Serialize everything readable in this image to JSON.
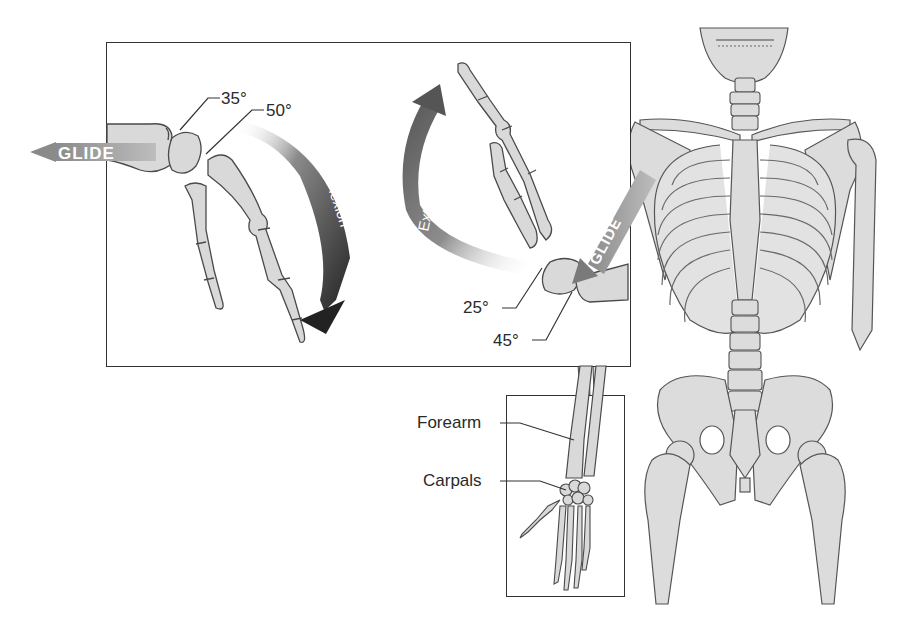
{
  "figure": {
    "main_panel": {
      "flexion_side": {
        "arrow_label": "Flexion",
        "glide_label": "GLIDE",
        "angles": [
          {
            "id": "a35",
            "label": "35°"
          },
          {
            "id": "a50",
            "label": "50°"
          }
        ]
      },
      "extension_side": {
        "arrow_label": "Extension",
        "glide_label": "GLIDE",
        "angles": [
          {
            "id": "a25",
            "label": "25°"
          },
          {
            "id": "a45",
            "label": "45°"
          }
        ]
      }
    },
    "hand_inset": {
      "labels": [
        {
          "id": "forearm",
          "text": "Forearm"
        },
        {
          "id": "carpals",
          "text": "Carpals"
        }
      ]
    },
    "colors": {
      "bone_fill": "#d9d9d9",
      "bone_stroke": "#4a4a4a",
      "arrow_dark": "#2b2b2b",
      "arrow_mid": "#7a7a7a",
      "frame": "#333333"
    }
  }
}
